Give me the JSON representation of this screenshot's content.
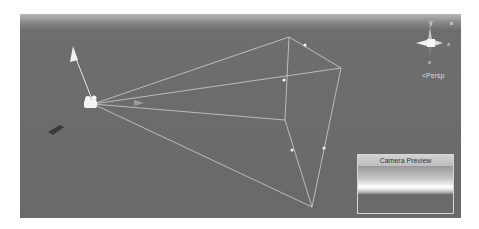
{
  "viewport": {
    "mode_label": "<Persp",
    "gizmo_axes": {
      "y": "y",
      "z": "z",
      "x": "x"
    }
  },
  "camera_preview": {
    "title": "Camera Preview"
  },
  "colors": {
    "viewport_bg": "#696969",
    "frustum_lines": "#d0d0d0",
    "preview_border": "#d6d6d6"
  }
}
